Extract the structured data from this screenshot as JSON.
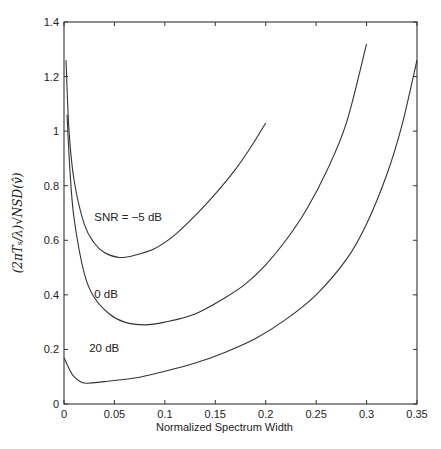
{
  "chart_data": {
    "type": "line",
    "title": "",
    "xlabel": "Normalized Spectrum Width",
    "ylabel": "(2πTₛ/λ)√NSD(v̂)",
    "xlim": [
      0,
      0.35
    ],
    "ylim": [
      0,
      1.4
    ],
    "grid": false,
    "legend": "none",
    "xticks": [
      0,
      0.05,
      0.1,
      0.15,
      0.2,
      0.25,
      0.3,
      0.35
    ],
    "xtick_labels": [
      "0",
      "0.05",
      "0.1",
      "0.15",
      "0.2",
      "0.25",
      "0.3",
      "0.35"
    ],
    "yticks": [
      0,
      0.2,
      0.4,
      0.6,
      0.8,
      1,
      1.2,
      1.4
    ],
    "ytick_labels": [
      "0",
      "0.2",
      "0.4",
      "0.6",
      "0.8",
      "1",
      "1.2",
      "1.4"
    ],
    "annotations": [
      {
        "text": "SNR = −5 dB",
        "x": 0.03,
        "y": 0.67
      },
      {
        "text": "0 dB",
        "x": 0.03,
        "y": 0.39
      },
      {
        "text": "20 dB",
        "x": 0.025,
        "y": 0.19
      }
    ],
    "series": [
      {
        "name": "SNR = -5 dB",
        "x": [
          0.002,
          0.005,
          0.01,
          0.02,
          0.03,
          0.04,
          0.055,
          0.07,
          0.09,
          0.11,
          0.13,
          0.15,
          0.17,
          0.185,
          0.2
        ],
        "y": [
          1.26,
          1.0,
          0.82,
          0.66,
          0.59,
          0.555,
          0.537,
          0.545,
          0.57,
          0.62,
          0.69,
          0.77,
          0.86,
          0.94,
          1.03
        ]
      },
      {
        "name": "0 dB",
        "x": [
          0.003,
          0.006,
          0.01,
          0.02,
          0.03,
          0.045,
          0.06,
          0.08,
          0.1,
          0.13,
          0.16,
          0.18,
          0.2,
          0.22,
          0.24,
          0.26,
          0.28,
          0.3
        ],
        "y": [
          1.06,
          0.85,
          0.68,
          0.48,
          0.39,
          0.33,
          0.3,
          0.29,
          0.3,
          0.33,
          0.39,
          0.44,
          0.51,
          0.6,
          0.71,
          0.85,
          1.03,
          1.32
        ]
      },
      {
        "name": "20 dB",
        "x": [
          0.0,
          0.005,
          0.01,
          0.02,
          0.04,
          0.07,
          0.1,
          0.13,
          0.16,
          0.19,
          0.22,
          0.25,
          0.28,
          0.3,
          0.32,
          0.335,
          0.35
        ],
        "y": [
          0.17,
          0.13,
          0.1,
          0.077,
          0.082,
          0.095,
          0.12,
          0.15,
          0.19,
          0.24,
          0.31,
          0.4,
          0.53,
          0.66,
          0.84,
          1.02,
          1.26
        ]
      }
    ]
  }
}
